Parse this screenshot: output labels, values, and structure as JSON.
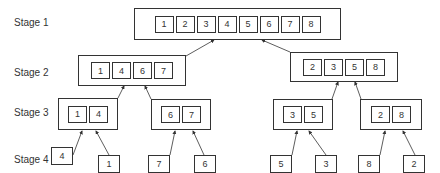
{
  "stages": {
    "s1": {
      "label": "Stage 1"
    },
    "s2": {
      "label": "Stage 2"
    },
    "s3": {
      "label": "Stage 3"
    },
    "s4": {
      "label": "Stage 4"
    }
  },
  "stage1": {
    "values": [
      "1",
      "2",
      "3",
      "4",
      "5",
      "6",
      "7",
      "8"
    ]
  },
  "stage2": {
    "left": {
      "values": [
        "1",
        "4",
        "6",
        "7"
      ]
    },
    "right": {
      "values": [
        "2",
        "3",
        "5",
        "8"
      ]
    }
  },
  "stage3": {
    "a": {
      "values": [
        "1",
        "4"
      ]
    },
    "b": {
      "values": [
        "6",
        "7"
      ]
    },
    "c": {
      "values": [
        "3",
        "5"
      ]
    },
    "d": {
      "values": [
        "2",
        "8"
      ]
    }
  },
  "stage4": {
    "values": [
      "4",
      "1",
      "7",
      "6",
      "5",
      "3",
      "8",
      "2"
    ]
  }
}
